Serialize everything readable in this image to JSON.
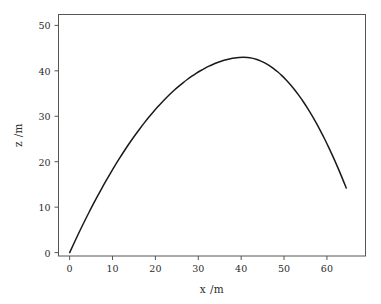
{
  "chart_data": {
    "type": "line",
    "title": "",
    "subtitle": "",
    "xlabel": "x /m",
    "ylabel": "z /m",
    "xlim": [
      -2.6,
      69.0
    ],
    "ylim": [
      -0.75,
      52.4
    ],
    "xticks": [
      0,
      10,
      20,
      30,
      40,
      50,
      60
    ],
    "xtick_labels": [
      "0",
      "10",
      "20",
      "30",
      "40",
      "50",
      "60"
    ],
    "yticks": [
      0,
      10,
      20,
      30,
      40,
      50
    ],
    "ytick_labels": [
      "0",
      "10",
      "20",
      "30",
      "40",
      "50"
    ],
    "grid": false,
    "legend": null,
    "legend_position": "none",
    "series": [
      {
        "name": "trajectory",
        "color": "#1a1a1a",
        "linewidth": 1.5,
        "x": [
          0.0,
          1.0,
          2.0,
          3.0,
          4.0,
          5.0,
          6.0,
          7.0,
          8.0,
          9.0,
          10.0,
          11.0,
          12.0,
          13.0,
          14.0,
          15.0,
          16.0,
          17.0,
          18.0,
          19.0,
          20.0,
          21.0,
          22.0,
          23.0,
          24.0,
          25.0,
          26.0,
          27.0,
          28.0,
          29.0,
          30.0,
          31.0,
          32.0,
          33.0,
          34.0,
          35.0,
          36.0,
          37.0,
          38.0,
          39.0,
          40.0,
          41.0,
          42.0,
          43.0,
          44.0,
          45.0,
          46.0,
          47.0,
          48.0,
          49.0,
          50.0,
          51.0,
          52.0,
          53.0,
          54.0,
          55.0,
          56.0,
          57.0,
          58.0,
          59.0,
          60.0,
          61.0,
          62.0,
          63.0,
          64.0,
          64.5
        ],
        "z": [
          0.0,
          2.05,
          4.05,
          6.0,
          7.9,
          9.75,
          11.55,
          13.3,
          15.0,
          16.65,
          18.25,
          19.8,
          21.3,
          22.75,
          24.15,
          25.5,
          26.8,
          28.05,
          29.25,
          30.4,
          31.5,
          32.55,
          33.55,
          34.5,
          35.4,
          36.25,
          37.05,
          37.8,
          38.5,
          39.15,
          39.75,
          40.3,
          40.8,
          41.25,
          41.65,
          42.0,
          42.3,
          42.55,
          42.75,
          42.9,
          43.0,
          43.0,
          42.9,
          42.7,
          42.4,
          42.0,
          41.5,
          40.9,
          40.2,
          39.4,
          38.5,
          37.5,
          36.4,
          35.2,
          33.9,
          32.5,
          31.0,
          29.4,
          27.7,
          25.9,
          24.0,
          22.0,
          19.9,
          17.7,
          15.4,
          14.2
        ]
      }
    ],
    "peak": {
      "x": 38.0,
      "z": 49.2
    },
    "start": {
      "x": 0.0,
      "z": 0.0
    },
    "end": {
      "x": 64.5,
      "z": 0.0
    }
  },
  "axes": {
    "spine_color": "#555555",
    "tick_color": "#555555",
    "background": "#ffffff"
  }
}
